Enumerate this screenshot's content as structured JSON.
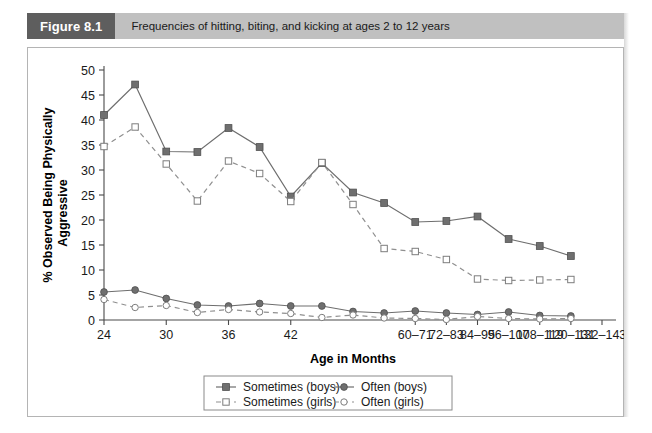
{
  "figure": {
    "badge": "Figure 8.1",
    "caption": "Frequencies of hitting, biting, and kicking at ages 2 to 12 years",
    "badge_color": "#5e5e5e",
    "bar_color": "#c0c0c0"
  },
  "chart_data": {
    "type": "line",
    "title": "",
    "xlabel": "Age in Months",
    "ylabel": "% Observed Being Physically Aggressive",
    "ylim": [
      0,
      50
    ],
    "yticks": [
      0,
      5,
      10,
      15,
      20,
      25,
      30,
      35,
      40,
      45,
      50
    ],
    "grid": false,
    "legend_position": "bottom",
    "x_tick_labels": [
      "24",
      "30",
      "36",
      "42",
      "60–71",
      "72–83",
      "84–95",
      "96–107",
      "108–119",
      "120–131",
      "132–143"
    ],
    "x_tick_indices": [
      0,
      2,
      4,
      6,
      10,
      11,
      12,
      13,
      14,
      15,
      16
    ],
    "x": [
      "24",
      "27",
      "30",
      "33",
      "36",
      "39",
      "42",
      "45",
      "48",
      "54",
      "60-71",
      "72-83",
      "84-95",
      "96-107",
      "108-119",
      "120-131",
      "132-143"
    ],
    "series": [
      {
        "name": "Sometimes (boys)",
        "marker": "filled-square",
        "linestyle": "solid",
        "color": "#6f6f6f",
        "values": [
          41.0,
          47.1,
          33.7,
          33.6,
          38.4,
          34.6,
          24.7,
          31.4,
          25.5,
          23.4,
          19.6,
          19.8,
          20.7,
          16.2,
          14.8,
          12.8,
          null
        ]
      },
      {
        "name": "Sometimes (girls)",
        "marker": "open-square",
        "linestyle": "dashed",
        "color": "#8f8f8f",
        "values": [
          34.7,
          38.6,
          31.2,
          23.8,
          31.8,
          29.3,
          23.7,
          31.5,
          23.1,
          14.3,
          13.7,
          12.1,
          8.2,
          7.9,
          8.0,
          8.1,
          null
        ]
      },
      {
        "name": "Often (boys)",
        "marker": "filled-circle",
        "linestyle": "solid",
        "color": "#6f6f6f",
        "values": [
          5.6,
          6.0,
          4.3,
          3.0,
          2.8,
          3.3,
          2.8,
          2.8,
          1.7,
          1.4,
          1.8,
          1.4,
          1.1,
          1.6,
          0.9,
          0.8,
          null
        ]
      },
      {
        "name": "Often (girls)",
        "marker": "open-circle",
        "linestyle": "dashed",
        "color": "#8f8f8f",
        "values": [
          4.1,
          2.5,
          2.9,
          1.5,
          2.1,
          1.6,
          1.3,
          0.5,
          1.0,
          0.4,
          0.3,
          0.1,
          0.7,
          0.3,
          0.2,
          0.3,
          null
        ]
      }
    ],
    "legend": [
      {
        "label": "Sometimes (boys)",
        "marker": "filled-square",
        "linestyle": "solid"
      },
      {
        "label": "Often (boys)",
        "marker": "filled-circle",
        "linestyle": "solid"
      },
      {
        "label": "Sometimes (girls)",
        "marker": "open-square",
        "linestyle": "dashed"
      },
      {
        "label": "Often (girls)",
        "marker": "open-circle",
        "linestyle": "dashed"
      }
    ]
  }
}
